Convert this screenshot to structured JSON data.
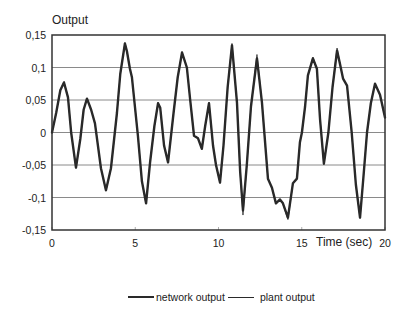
{
  "chart_data": {
    "type": "line",
    "title": "Output",
    "xlabel": "Time (sec)",
    "ylabel": "Output",
    "xlim": [
      0,
      20
    ],
    "ylim": [
      -0.15,
      0.15
    ],
    "x_ticks": [
      "0",
      "5",
      "10",
      "15",
      "20"
    ],
    "y_ticks": [
      "0,15",
      "0,1",
      "0,05",
      "0",
      "-0,05",
      "-0,1",
      "-0,15"
    ],
    "grid": "horizontal",
    "legend_position": "bottom",
    "legend": [
      "network output",
      "plant output"
    ],
    "series": [
      {
        "name": "network output",
        "style": "thick",
        "x": [
          0,
          0.25,
          0.5,
          0.72,
          0.96,
          1.15,
          1.44,
          1.7,
          1.9,
          2.1,
          2.35,
          2.58,
          2.94,
          3.24,
          3.54,
          3.9,
          4.1,
          4.38,
          4.5,
          4.68,
          4.8,
          5.16,
          5.4,
          5.65,
          5.89,
          6.15,
          6.37,
          6.5,
          6.73,
          6.97,
          7.3,
          7.55,
          7.81,
          8.1,
          8.3,
          8.53,
          8.77,
          9.0,
          9.2,
          9.43,
          9.67,
          9.85,
          10.09,
          10.3,
          10.55,
          10.81,
          11.11,
          11.3,
          11.47,
          11.7,
          11.95,
          12.31,
          12.61,
          12.97,
          13.21,
          13.45,
          13.69,
          13.87,
          14.17,
          14.47,
          14.71,
          14.89,
          15.01,
          15.2,
          15.37,
          15.67,
          15.91,
          16.1,
          16.33,
          16.6,
          16.85,
          17.12,
          17.3,
          17.48,
          17.72,
          18.0,
          18.25,
          18.5,
          18.7,
          18.92,
          19.15,
          19.4,
          19.7,
          20.0
        ],
        "values": [
          0.0,
          0.03,
          0.065,
          0.077,
          0.054,
          0.0,
          -0.054,
          -0.01,
          0.035,
          0.052,
          0.035,
          0.014,
          -0.055,
          -0.089,
          -0.055,
          0.03,
          0.09,
          0.137,
          0.125,
          0.098,
          0.085,
          -0.005,
          -0.075,
          -0.109,
          -0.046,
          0.01,
          0.045,
          0.038,
          -0.02,
          -0.046,
          0.03,
          0.085,
          0.123,
          0.1,
          0.05,
          -0.005,
          -0.009,
          -0.025,
          0.01,
          0.045,
          -0.02,
          -0.05,
          -0.077,
          -0.02,
          0.07,
          0.134,
          0.046,
          -0.06,
          -0.12,
          -0.05,
          0.04,
          0.114,
          0.046,
          -0.071,
          -0.085,
          -0.109,
          -0.103,
          -0.109,
          -0.131,
          -0.078,
          -0.071,
          -0.015,
          0.0,
          0.04,
          0.088,
          0.114,
          0.098,
          0.02,
          -0.048,
          0.0,
          0.07,
          0.126,
          0.105,
          0.083,
          0.072,
          0.0,
          -0.08,
          -0.131,
          -0.07,
          0.0,
          0.045,
          0.075,
          0.058,
          0.023
        ]
      },
      {
        "name": "plant output",
        "style": "thin",
        "x": [
          0,
          0.25,
          0.5,
          0.72,
          0.96,
          1.15,
          1.44,
          1.7,
          1.9,
          2.1,
          2.35,
          2.58,
          2.94,
          3.24,
          3.54,
          3.9,
          4.1,
          4.38,
          4.5,
          4.68,
          4.8,
          5.16,
          5.4,
          5.65,
          5.89,
          6.15,
          6.37,
          6.5,
          6.73,
          6.97,
          7.3,
          7.55,
          7.81,
          8.1,
          8.3,
          8.53,
          8.77,
          9.0,
          9.2,
          9.43,
          9.67,
          9.85,
          10.09,
          10.3,
          10.55,
          10.81,
          11.11,
          11.3,
          11.47,
          11.7,
          11.95,
          12.31,
          12.61,
          12.97,
          13.21,
          13.45,
          13.69,
          13.87,
          14.17,
          14.47,
          14.71,
          14.89,
          15.01,
          15.2,
          15.37,
          15.67,
          15.91,
          16.1,
          16.33,
          16.6,
          16.85,
          17.12,
          17.3,
          17.48,
          17.72,
          18.0,
          18.25,
          18.5,
          18.7,
          18.92,
          19.15,
          19.4,
          19.7,
          20.0
        ],
        "values": [
          0.0,
          0.03,
          0.066,
          0.078,
          0.055,
          0.0,
          -0.055,
          -0.01,
          0.035,
          0.053,
          0.035,
          0.014,
          -0.055,
          -0.09,
          -0.056,
          0.03,
          0.09,
          0.138,
          0.126,
          0.098,
          0.085,
          -0.005,
          -0.075,
          -0.11,
          -0.046,
          0.01,
          0.046,
          0.038,
          -0.02,
          -0.047,
          0.03,
          0.085,
          0.124,
          0.1,
          0.05,
          -0.005,
          -0.009,
          -0.026,
          0.01,
          0.046,
          -0.02,
          -0.05,
          -0.078,
          -0.02,
          0.07,
          0.137,
          0.046,
          -0.062,
          -0.127,
          -0.05,
          0.04,
          0.12,
          0.046,
          -0.071,
          -0.085,
          -0.11,
          -0.103,
          -0.11,
          -0.134,
          -0.078,
          -0.071,
          -0.015,
          0.0,
          0.04,
          0.088,
          0.116,
          0.098,
          0.02,
          -0.049,
          0.0,
          0.07,
          0.13,
          0.105,
          0.083,
          0.072,
          0.0,
          -0.08,
          -0.132,
          -0.07,
          0.0,
          0.045,
          0.076,
          0.058,
          0.023
        ]
      }
    ]
  },
  "legend": {
    "network_label": "network output",
    "plant_label": "plant output"
  },
  "colors": {
    "network": "#2a2a2a",
    "plant": "#2a2a2a",
    "grid": "#8a8a8a",
    "axis": "#333333"
  }
}
